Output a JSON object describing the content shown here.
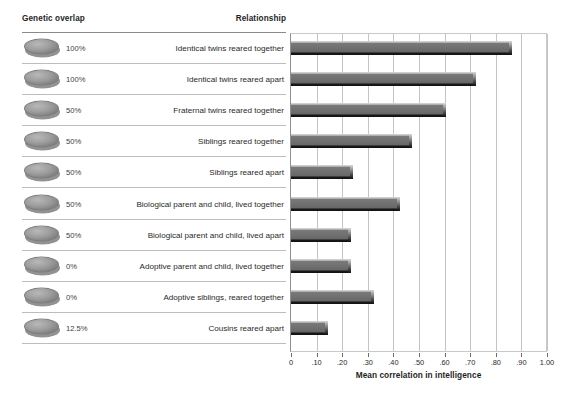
{
  "headers": {
    "genetic_overlap": "Genetic overlap",
    "relationship": "Relationship"
  },
  "axis_title": "Mean correlation in intelligence",
  "colors": {
    "bar_face": "#6e6e6e",
    "bar_highlight": "#cfcfcf",
    "bar_shadow": "#111111",
    "gridline": "#c4c4c4",
    "row_rule": "#bdbdbd",
    "header_rule": "#8a8a8a",
    "text": "#2a2a2a",
    "disc": "#9d9d9d"
  },
  "rows": [
    {
      "icon": "gray-disc-icon",
      "genetic_overlap": "100%",
      "relationship": "Identical twins reared together",
      "value": 0.86
    },
    {
      "icon": "gray-disc-icon",
      "genetic_overlap": "100%",
      "relationship": "Identical twins reared apart",
      "value": 0.72
    },
    {
      "icon": "gray-disc-icon",
      "genetic_overlap": "50%",
      "relationship": "Fraternal twins reared together",
      "value": 0.6
    },
    {
      "icon": "gray-disc-icon",
      "genetic_overlap": "50%",
      "relationship": "Siblings reared together",
      "value": 0.47
    },
    {
      "icon": "gray-disc-icon",
      "genetic_overlap": "50%",
      "relationship": "Siblings reared apart",
      "value": 0.24
    },
    {
      "icon": "gray-disc-icon",
      "genetic_overlap": "50%",
      "relationship": "Biological parent and child, lived together",
      "value": 0.42
    },
    {
      "icon": "gray-disc-icon",
      "genetic_overlap": "50%",
      "relationship": "Biological parent and child, lived apart",
      "value": 0.23
    },
    {
      "icon": "gray-disc-icon",
      "genetic_overlap": "0%",
      "relationship": "Adoptive parent and child, lived together",
      "value": 0.23
    },
    {
      "icon": "gray-disc-icon",
      "genetic_overlap": "0%",
      "relationship": "Adoptive siblings, reared together",
      "value": 0.32
    },
    {
      "icon": "gray-disc-icon",
      "genetic_overlap": "12.5%",
      "relationship": "Cousins reared apart",
      "value": 0.14
    }
  ],
  "chart_data": {
    "type": "bar",
    "orientation": "horizontal",
    "title": "",
    "xlabel": "Mean correlation in intelligence",
    "ylabel": "",
    "xlim": [
      0,
      1.0
    ],
    "grid": true,
    "legend": "none",
    "tick_labels": [
      "0",
      ".10",
      ".20",
      ".30",
      ".40",
      ".50",
      ".60",
      ".70",
      ".80",
      ".90",
      "1.00"
    ],
    "tick_values": [
      0,
      0.1,
      0.2,
      0.3,
      0.4,
      0.5,
      0.6,
      0.7,
      0.8,
      0.9,
      1.0
    ],
    "categories": [
      "Identical twins reared together",
      "Identical twins reared apart",
      "Fraternal twins reared together",
      "Siblings reared together",
      "Siblings reared apart",
      "Biological parent and child, lived together",
      "Biological parent and child, lived apart",
      "Adoptive parent and child, lived together",
      "Adoptive siblings, reared together",
      "Cousins reared apart"
    ],
    "values": [
      0.86,
      0.72,
      0.6,
      0.47,
      0.24,
      0.42,
      0.23,
      0.23,
      0.32,
      0.14
    ],
    "secondary_axis": {
      "name": "Genetic overlap",
      "values": [
        "100%",
        "100%",
        "50%",
        "50%",
        "50%",
        "50%",
        "50%",
        "0%",
        "0%",
        "12.5%"
      ]
    }
  }
}
